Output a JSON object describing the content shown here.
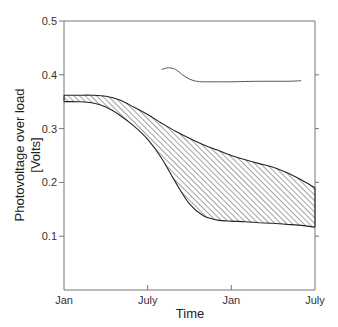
{
  "chart_data": {
    "type": "area",
    "title": "",
    "xlabel": "Time",
    "ylabel": "Photovoltage over load [Volts]",
    "ylabel_lines": [
      "Photovoltage over load",
      "[Volts]"
    ],
    "x_ticks": [
      "Jan",
      "July",
      "Jan",
      "July"
    ],
    "y_ticks": [
      "0.1",
      "0.2",
      "0.3",
      "0.4",
      "0.5"
    ],
    "ylim": [
      0.0,
      0.5
    ],
    "xlim_months": [
      0,
      18
    ],
    "grid": false,
    "legend": null,
    "series": [
      {
        "name": "Photovoltage band (hatched)",
        "kind": "band",
        "x_months": [
          0,
          1,
          2,
          3,
          4,
          5,
          6,
          7,
          8,
          9,
          10,
          11,
          12,
          13,
          14,
          15,
          16,
          17,
          18
        ],
        "upper": [
          0.362,
          0.362,
          0.362,
          0.36,
          0.353,
          0.34,
          0.326,
          0.31,
          0.295,
          0.282,
          0.27,
          0.26,
          0.25,
          0.242,
          0.235,
          0.228,
          0.218,
          0.205,
          0.19
        ],
        "lower": [
          0.35,
          0.35,
          0.348,
          0.34,
          0.325,
          0.305,
          0.28,
          0.245,
          0.2,
          0.16,
          0.138,
          0.13,
          0.128,
          0.127,
          0.125,
          0.124,
          0.122,
          0.12,
          0.117
        ]
      },
      {
        "name": "Upper line",
        "kind": "line",
        "x_months": [
          7.0,
          7.5,
          8.0,
          8.5,
          9.0,
          9.5,
          10.0,
          11.0,
          12.0,
          14.0,
          16.0,
          17.0
        ],
        "values": [
          0.41,
          0.413,
          0.41,
          0.4,
          0.392,
          0.388,
          0.387,
          0.387,
          0.387,
          0.388,
          0.388,
          0.389
        ]
      }
    ]
  }
}
